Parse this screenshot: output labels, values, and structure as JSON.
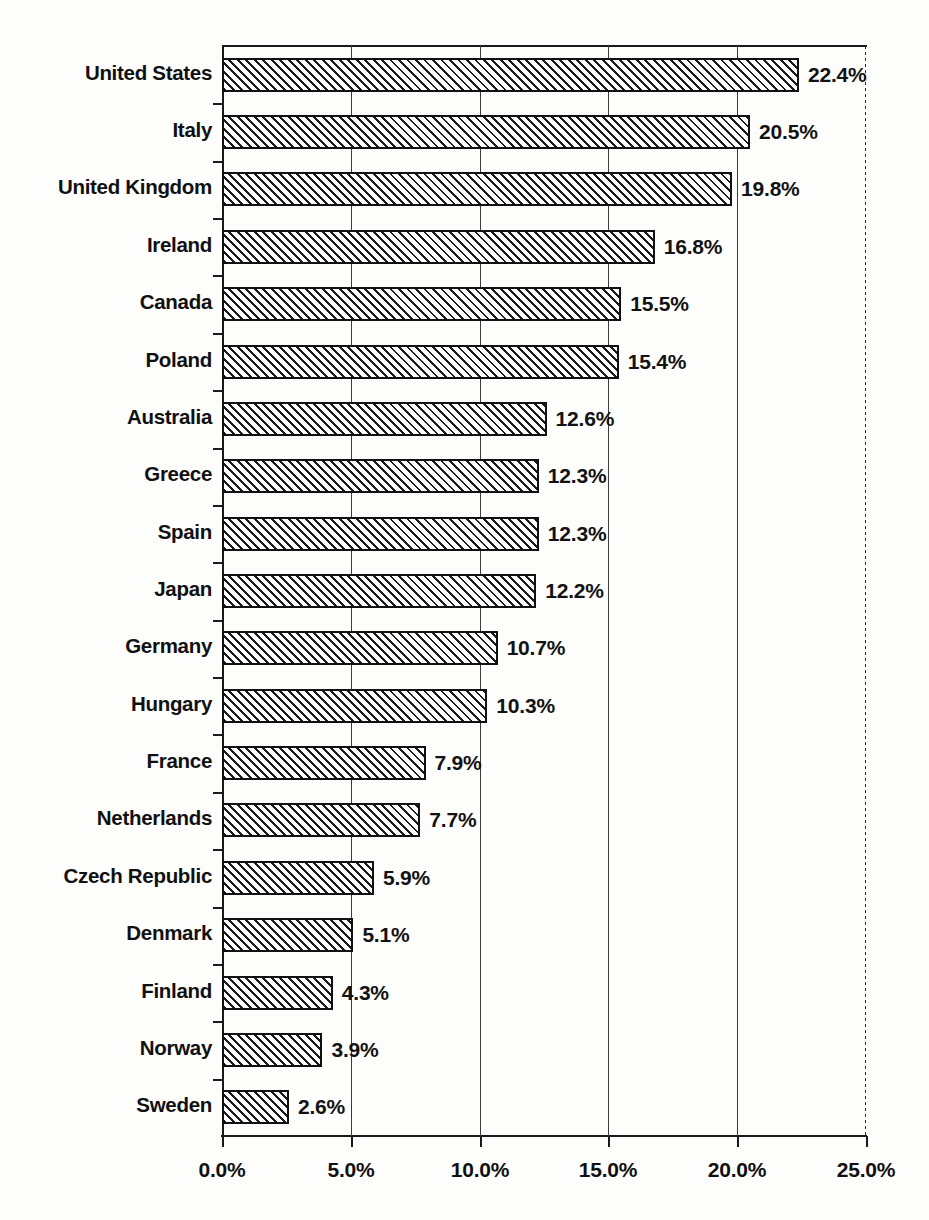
{
  "chart_data": {
    "type": "bar",
    "orientation": "horizontal",
    "title": "",
    "subtitle": "",
    "xlabel": "",
    "ylabel": "",
    "xlim": [
      0,
      25
    ],
    "grid": true,
    "legend": false,
    "value_suffix": "%",
    "categories": [
      "United States",
      "Italy",
      "United Kingdom",
      "Ireland",
      "Canada",
      "Poland",
      "Australia",
      "Greece",
      "Spain",
      "Japan",
      "Germany",
      "Hungary",
      "France",
      "Netherlands",
      "Czech Republic",
      "Denmark",
      "Finland",
      "Norway",
      "Sweden"
    ],
    "values": [
      22.4,
      20.5,
      19.8,
      16.8,
      15.5,
      15.4,
      12.6,
      12.3,
      12.3,
      12.2,
      10.7,
      10.3,
      7.9,
      7.7,
      5.9,
      5.1,
      4.3,
      3.9,
      2.6
    ],
    "data_labels": [
      "22.4%",
      "20.5%",
      "19.8%",
      "16.8%",
      "15.5%",
      "15.4%",
      "12.6%",
      "12.3%",
      "12.3%",
      "12.2%",
      "10.7%",
      "10.3%",
      "7.9%",
      "7.7%",
      "5.9%",
      "5.1%",
      "4.3%",
      "3.9%",
      "2.6%"
    ],
    "xticks": [
      0,
      5,
      10,
      15,
      20,
      25
    ],
    "xtick_labels": [
      "0.0%",
      "5.0%",
      "10.0%",
      "15.0%",
      "20.0%",
      "25.0%"
    ],
    "bar_style": {
      "fill": "#ffffff",
      "hatch": "diagonal-stripes",
      "edge_color": "#111111"
    },
    "colors": {
      "background": "#fdfdfc",
      "axis": "#1a1a1a",
      "grid": "#3c3c3c",
      "text": "#101010"
    }
  }
}
